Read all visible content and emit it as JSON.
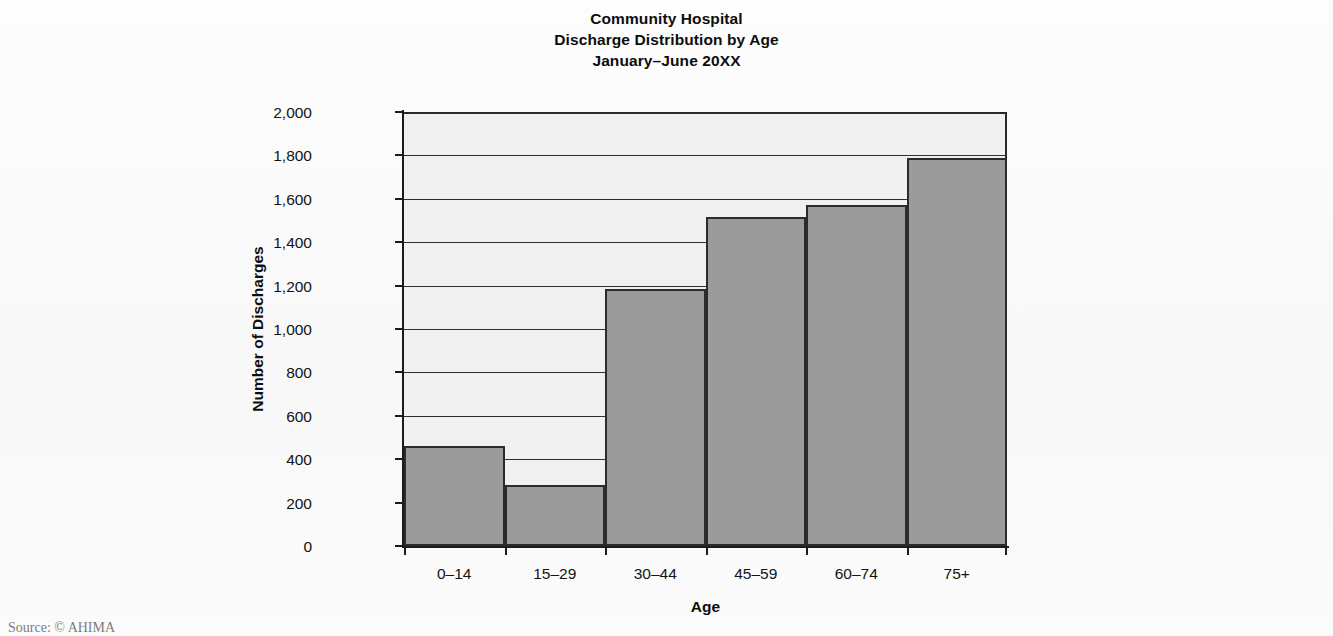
{
  "chart_data": {
    "type": "bar",
    "title": "Community Hospital Discharge Distribution by Age January–June 20XX",
    "title_lines": [
      "Community Hospital",
      "Discharge Distribution by Age",
      "January–June 20XX"
    ],
    "categories": [
      "0–14",
      "15–29",
      "30–44",
      "45–59",
      "60–74",
      "75+"
    ],
    "values": [
      460,
      280,
      1185,
      1515,
      1570,
      1790
    ],
    "xlabel": "Age",
    "ylabel": "Number of Discharges",
    "ylim": [
      0,
      2000
    ],
    "ytick_step": 200,
    "ytick_labels": [
      "0",
      "200",
      "400",
      "600",
      "800",
      "1,000",
      "1,200",
      "1,400",
      "1,600",
      "1,800",
      "2,000"
    ],
    "ytick_values": [
      0,
      200,
      400,
      600,
      800,
      1000,
      1200,
      1400,
      1600,
      1800,
      2000
    ],
    "grid": true,
    "grid_axis": "y",
    "legend": false,
    "bar_gap": 0,
    "colors": {
      "bar_fill": "#9b9b9b",
      "bar_border": "#2b2b2b",
      "plot_background": "#f1f1f1",
      "page_background": "#fcfcfc",
      "axis": "#1b1b1b",
      "grid": "#2e2e2e",
      "text": "#111111"
    }
  },
  "footer": {
    "source": "Source: © AHIMA"
  }
}
